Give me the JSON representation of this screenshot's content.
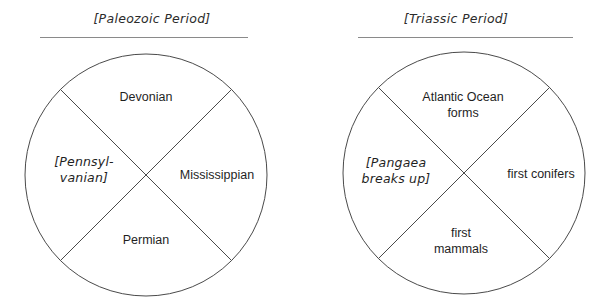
{
  "worksheet": {
    "background_color": "#ffffff",
    "ink_color": "#1f1f1f",
    "line_color": "#4a4a4a",
    "rule_color": "#8a8a8a"
  },
  "panels": [
    {
      "title": "[Paleozoic Period]",
      "wheel_name": "paleozoic-period-wheel",
      "sectors": {
        "top": {
          "label": "Devonian",
          "style": "plain"
        },
        "right": {
          "label": "Mississippian",
          "style": "plain"
        },
        "bottom": {
          "label": "Permian",
          "style": "plain"
        },
        "left_line1": "[Pennsyl-",
        "left_line2": "vanian]"
      }
    },
    {
      "title": "[Triassic Period]",
      "wheel_name": "triassic-period-wheel",
      "sectors": {
        "top_line1": "Atlantic Ocean",
        "top_line2": "forms",
        "right": {
          "label": "first conifers",
          "style": "plain"
        },
        "bottom_line1": "first",
        "bottom_line2": "mammals",
        "left_line1": "[Pangaea",
        "left_line2": "breaks up]"
      }
    }
  ]
}
